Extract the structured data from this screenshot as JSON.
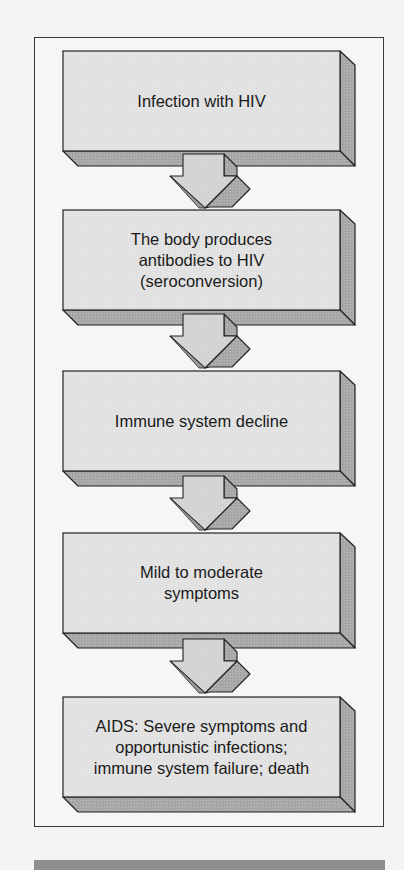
{
  "diagram": {
    "type": "flowchart",
    "direction": "top-to-bottom",
    "colors": {
      "background": "#f4f4f2",
      "box_face": "#e2e2e2",
      "box_side": "#a9a9a9",
      "box_bottom": "#b3b3b3",
      "arrow_face": "#d6d6d6",
      "arrow_side": "#a3a3a3",
      "outline": "#222222",
      "bottom_bar": "#8e8e8e"
    },
    "steps": [
      {
        "id": "step-1",
        "label": "Infection with HIV"
      },
      {
        "id": "step-2",
        "label": "The body produces\nantibodies to HIV\n(seroconversion)"
      },
      {
        "id": "step-3",
        "label": "Immune system decline"
      },
      {
        "id": "step-4",
        "label": "Mild to moderate\nsymptoms"
      },
      {
        "id": "step-5",
        "label": "AIDS: Severe symptoms and\nopportunistic infections;\nimmune system failure; death"
      }
    ],
    "arrows": [
      {
        "from": "step-1",
        "to": "step-2"
      },
      {
        "from": "step-2",
        "to": "step-3"
      },
      {
        "from": "step-3",
        "to": "step-4"
      },
      {
        "from": "step-4",
        "to": "step-5"
      }
    ]
  }
}
